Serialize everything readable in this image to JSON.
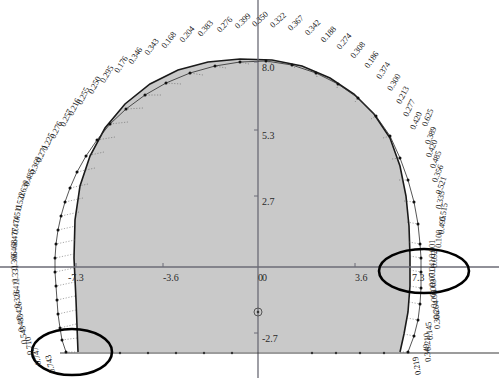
{
  "figure": {
    "fill_color": "#c9c9c9",
    "outline_color": "#1a1a1a",
    "axis_color": "#6b6b76",
    "label_color": "#1a1a1a",
    "highlight_color": "#000000"
  },
  "axes": {
    "x_ticks": [
      {
        "label": "-7.3",
        "x": 68,
        "y": 272
      },
      {
        "label": "-3.6",
        "x": 163,
        "y": 272
      },
      {
        "label": "0",
        "x": 258,
        "y": 272
      },
      {
        "label": "3.6",
        "x": 355,
        "y": 272
      },
      {
        "label": "7.3",
        "x": 412,
        "y": 272
      }
    ],
    "y_ticks": [
      {
        "label": "8.0",
        "x": 262,
        "y": 62
      },
      {
        "label": "5.3",
        "x": 262,
        "y": 130
      },
      {
        "label": "2.7",
        "x": 262,
        "y": 196
      },
      {
        "label": "0",
        "x": 262,
        "y": 272
      },
      {
        "label": "-2.7",
        "x": 262,
        "y": 333
      }
    ],
    "origin_marker": "circle-marker"
  },
  "chart_data": {
    "type": "scatter",
    "xlabel": "",
    "ylabel": "",
    "xlim": [
      -7.3,
      7.3
    ],
    "ylim": [
      -2.7,
      8.0
    ],
    "grid": false,
    "legend": "none",
    "annotations": [
      {
        "name": "highlight-ellipse-left",
        "cx": 72,
        "cy": 352,
        "rx": 40,
        "ry": 23
      },
      {
        "name": "highlight-ellipse-right",
        "cx": 424,
        "cy": 271,
        "rx": 45,
        "ry": 22
      }
    ],
    "point_labels": [
      {
        "value": "0.257",
        "x": 62,
        "y": 121,
        "angle": -64
      },
      {
        "value": "0.216",
        "x": 70,
        "y": 110,
        "angle": -64
      },
      {
        "value": "0.255",
        "x": 79,
        "y": 99,
        "angle": -64
      },
      {
        "value": "0.250",
        "x": 90,
        "y": 88,
        "angle": -62
      },
      {
        "value": "0.295",
        "x": 102,
        "y": 77,
        "angle": -60
      },
      {
        "value": "0.176",
        "x": 116,
        "y": 67,
        "angle": -58
      },
      {
        "value": "0.346",
        "x": 130,
        "y": 58,
        "angle": -56
      },
      {
        "value": "0.343",
        "x": 146,
        "y": 49,
        "angle": -54
      },
      {
        "value": "0.168",
        "x": 163,
        "y": 42,
        "angle": -52
      },
      {
        "value": "0.204",
        "x": 181,
        "y": 36,
        "angle": -50
      },
      {
        "value": "0.383",
        "x": 199,
        "y": 30,
        "angle": -48
      },
      {
        "value": "0.276",
        "x": 218,
        "y": 26,
        "angle": -46
      },
      {
        "value": "0.399",
        "x": 236,
        "y": 22,
        "angle": -44
      },
      {
        "value": "0.350",
        "x": 253,
        "y": 20,
        "angle": -42
      },
      {
        "value": "0.322",
        "x": 271,
        "y": 21,
        "angle": -42
      },
      {
        "value": "0.367",
        "x": 289,
        "y": 24,
        "angle": -44
      },
      {
        "value": "0.342",
        "x": 306,
        "y": 29,
        "angle": -46
      },
      {
        "value": "0.188",
        "x": 322,
        "y": 36,
        "angle": -48
      },
      {
        "value": "0.274",
        "x": 338,
        "y": 43,
        "angle": -50
      },
      {
        "value": "0.308",
        "x": 352,
        "y": 52,
        "angle": -52
      },
      {
        "value": "0.186",
        "x": 366,
        "y": 62,
        "angle": -55
      },
      {
        "value": "0.374",
        "x": 378,
        "y": 73,
        "angle": -57
      },
      {
        "value": "0.300",
        "x": 389,
        "y": 85,
        "angle": -59
      },
      {
        "value": "0.213",
        "x": 398,
        "y": 98,
        "angle": -62
      },
      {
        "value": "0.277",
        "x": 405,
        "y": 111,
        "angle": -64
      },
      {
        "value": "0.420",
        "x": 412,
        "y": 124,
        "angle": -66
      },
      {
        "value": "0.625",
        "x": 424,
        "y": 121,
        "angle": -68
      },
      {
        "value": "0.389",
        "x": 427,
        "y": 139,
        "angle": -68
      },
      {
        "value": "0.420",
        "x": 428,
        "y": 152,
        "angle": -68
      },
      {
        "value": "0.485",
        "x": 432,
        "y": 163,
        "angle": -68
      },
      {
        "value": "0.356",
        "x": 434,
        "y": 177,
        "angle": -68
      },
      {
        "value": "0.521",
        "x": 438,
        "y": 189,
        "angle": -72
      },
      {
        "value": "0.335",
        "x": 438,
        "y": 204,
        "angle": -78
      },
      {
        "value": "0.515",
        "x": 442,
        "y": 216,
        "angle": -82
      },
      {
        "value": "0.495",
        "x": 441,
        "y": 229,
        "angle": -86
      },
      {
        "value": "0.100",
        "x": 438,
        "y": 243,
        "angle": -88
      },
      {
        "value": "0.001",
        "x": 432,
        "y": 253,
        "angle": -90
      },
      {
        "value": "0.092",
        "x": 434,
        "y": 263,
        "angle": -90
      },
      {
        "value": "0.041",
        "x": 432,
        "y": 272,
        "angle": -90
      },
      {
        "value": "0.071",
        "x": 432,
        "y": 282,
        "angle": -90
      },
      {
        "value": "0.069",
        "x": 433,
        "y": 292,
        "angle": -90
      },
      {
        "value": "0.095",
        "x": 434,
        "y": 303,
        "angle": -90
      },
      {
        "value": "0.264",
        "x": 436,
        "y": 314,
        "angle": -92
      },
      {
        "value": "0.366",
        "x": 437,
        "y": 324,
        "angle": -92
      },
      {
        "value": "0.145",
        "x": 430,
        "y": 335,
        "angle": -96
      },
      {
        "value": "0.210",
        "x": 428,
        "y": 346,
        "angle": -96
      },
      {
        "value": "0.349",
        "x": 428,
        "y": 357,
        "angle": -98
      },
      {
        "value": "0.219",
        "x": 418,
        "y": 370,
        "angle": -100
      },
      {
        "value": "0.276",
        "x": 52,
        "y": 133,
        "angle": -64
      },
      {
        "value": "0.225",
        "x": 44,
        "y": 145,
        "angle": -66
      },
      {
        "value": "0.271",
        "x": 38,
        "y": 157,
        "angle": -68
      },
      {
        "value": "0.369",
        "x": 32,
        "y": 169,
        "angle": -70
      },
      {
        "value": "0.485",
        "x": 26,
        "y": 181,
        "angle": -72
      },
      {
        "value": "0.630",
        "x": 21,
        "y": 193,
        "angle": -74
      },
      {
        "value": "0.522",
        "x": 18,
        "y": 205,
        "angle": -78
      },
      {
        "value": "0.511",
        "x": 16,
        "y": 217,
        "angle": -82
      },
      {
        "value": "0.474",
        "x": 15,
        "y": 229,
        "angle": -86
      },
      {
        "value": "0.477",
        "x": 14,
        "y": 241,
        "angle": -88
      },
      {
        "value": "0.468",
        "x": 14,
        "y": 253,
        "angle": -90
      },
      {
        "value": "0.366",
        "x": 14,
        "y": 265,
        "angle": -90
      },
      {
        "value": "0.331",
        "x": 15,
        "y": 278,
        "angle": -90
      },
      {
        "value": "0.411",
        "x": 16,
        "y": 291,
        "angle": -90
      },
      {
        "value": "0.326",
        "x": 17,
        "y": 303,
        "angle": -92
      },
      {
        "value": "0.426",
        "x": 19,
        "y": 315,
        "angle": -92
      },
      {
        "value": "0.483",
        "x": 21,
        "y": 327,
        "angle": -94
      },
      {
        "value": "0.543",
        "x": 24,
        "y": 339,
        "angle": -96
      },
      {
        "value": "0.710",
        "x": 30,
        "y": 350,
        "angle": -98
      },
      {
        "value": "0.747",
        "x": 38,
        "y": 360,
        "angle": -100
      },
      {
        "value": "0.743",
        "x": 52,
        "y": 368,
        "angle": -104
      }
    ]
  }
}
